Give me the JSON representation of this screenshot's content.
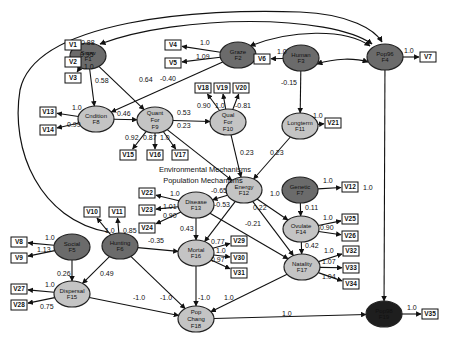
{
  "title": "",
  "captions": {
    "env": "Environmental Mechanisms",
    "pop": "Population Mechanisms"
  },
  "colors": {
    "dark": "#6b6b6b",
    "light": "#c4c4c4",
    "black": "#1e1e1e"
  },
  "factors": [
    {
      "id": "F1",
      "name": "Snow",
      "x": 88,
      "y": 56,
      "shade": "dark"
    },
    {
      "id": "F2",
      "name": "Graze",
      "x": 238,
      "y": 55,
      "shade": "dark"
    },
    {
      "id": "F3",
      "name": "Human",
      "x": 301,
      "y": 58,
      "shade": "dark"
    },
    {
      "id": "F4",
      "name": "Pop96",
      "x": 385,
      "y": 57,
      "shade": "dark"
    },
    {
      "id": "F8",
      "name": "Cndition",
      "x": 96,
      "y": 119,
      "shade": "light"
    },
    {
      "id": "F9",
      "name": "Quant For",
      "x": 155,
      "y": 120,
      "shade": "light"
    },
    {
      "id": "F10",
      "name": "Qual For",
      "x": 228,
      "y": 122,
      "shade": "light"
    },
    {
      "id": "F11",
      "name": "Longterm",
      "x": 300,
      "y": 126,
      "shade": "light"
    },
    {
      "id": "F12",
      "name": "Energy",
      "x": 244,
      "y": 190,
      "shade": "light"
    },
    {
      "id": "F7",
      "name": "Genetic",
      "x": 300,
      "y": 190,
      "shade": "dark"
    },
    {
      "id": "F13",
      "name": "Disease",
      "x": 196,
      "y": 205,
      "shade": "light"
    },
    {
      "id": "F14",
      "name": "Ovulate",
      "x": 301,
      "y": 229,
      "shade": "light"
    },
    {
      "id": "F5",
      "name": "Social",
      "x": 72,
      "y": 247,
      "shade": "dark"
    },
    {
      "id": "F6",
      "name": "Hunting",
      "x": 120,
      "y": 246,
      "shade": "dark"
    },
    {
      "id": "F16",
      "name": "Mortal",
      "x": 196,
      "y": 253,
      "shade": "light"
    },
    {
      "id": "F17",
      "name": "Natality",
      "x": 302,
      "y": 267,
      "shade": "light"
    },
    {
      "id": "F15",
      "name": "Dispersal",
      "x": 72,
      "y": 294,
      "shade": "light"
    },
    {
      "id": "F18",
      "name": "Pop Chang",
      "x": 196,
      "y": 319,
      "shade": "light"
    },
    {
      "id": "F19",
      "name": "Pop98",
      "x": 384,
      "y": 314,
      "shade": "black"
    }
  ],
  "indicators": [
    {
      "id": "V1",
      "x": 73,
      "y": 45
    },
    {
      "id": "V2",
      "x": 73,
      "y": 62
    },
    {
      "id": "V3",
      "x": 73,
      "y": 78
    },
    {
      "id": "V4",
      "x": 173,
      "y": 45
    },
    {
      "id": "V5",
      "x": 173,
      "y": 63
    },
    {
      "id": "V6",
      "x": 262,
      "y": 59
    },
    {
      "id": "V7",
      "x": 428,
      "y": 57
    },
    {
      "id": "V13",
      "x": 48,
      "y": 112
    },
    {
      "id": "V14",
      "x": 48,
      "y": 130
    },
    {
      "id": "V18",
      "x": 203,
      "y": 88
    },
    {
      "id": "V19",
      "x": 222,
      "y": 88
    },
    {
      "id": "V20",
      "x": 241,
      "y": 88
    },
    {
      "id": "V21",
      "x": 333,
      "y": 123
    },
    {
      "id": "V15",
      "x": 128,
      "y": 155
    },
    {
      "id": "V16",
      "x": 155,
      "y": 155
    },
    {
      "id": "V17",
      "x": 180,
      "y": 155
    },
    {
      "id": "V12",
      "x": 350,
      "y": 187
    },
    {
      "id": "V22",
      "x": 147,
      "y": 193
    },
    {
      "id": "V23",
      "x": 147,
      "y": 210
    },
    {
      "id": "V24",
      "x": 147,
      "y": 228
    },
    {
      "id": "V10",
      "x": 92,
      "y": 212
    },
    {
      "id": "V11",
      "x": 117,
      "y": 212
    },
    {
      "id": "V25",
      "x": 350,
      "y": 219
    },
    {
      "id": "V26",
      "x": 350,
      "y": 236
    },
    {
      "id": "V8",
      "x": 19,
      "y": 242
    },
    {
      "id": "V9",
      "x": 19,
      "y": 258
    },
    {
      "id": "V29",
      "x": 239,
      "y": 241
    },
    {
      "id": "V30",
      "x": 239,
      "y": 258
    },
    {
      "id": "V31",
      "x": 239,
      "y": 273
    },
    {
      "id": "V32",
      "x": 351,
      "y": 251
    },
    {
      "id": "V33",
      "x": 351,
      "y": 268
    },
    {
      "id": "V34",
      "x": 351,
      "y": 284
    },
    {
      "id": "V27",
      "x": 19,
      "y": 289
    },
    {
      "id": "V28",
      "x": 19,
      "y": 305
    },
    {
      "id": "V35",
      "x": 430,
      "y": 314
    }
  ],
  "paths": [
    {
      "from": "F1",
      "to": "V1",
      "coef": "0.88",
      "lx": 81,
      "ly": 45
    },
    {
      "from": "F1",
      "to": "V2",
      "coef": "0.95",
      "lx": 80,
      "ly": 57
    },
    {
      "from": "F1",
      "to": "V3",
      "coef": "1.0",
      "lx": 84,
      "ly": 69
    },
    {
      "from": "F1",
      "to": "F8",
      "coef": "0.58",
      "lx": 95,
      "ly": 83
    },
    {
      "from": "F1",
      "to": "F9",
      "coef": "0.64",
      "lx": 139,
      "ly": 82
    },
    {
      "from": "F2",
      "to": "V4",
      "coef": "1.0",
      "lx": 200,
      "ly": 45
    },
    {
      "from": "F2",
      "to": "V5",
      "coef": "1.09",
      "lx": 196,
      "ly": 59
    },
    {
      "from": "F2",
      "to": "F8",
      "coef": "-0.40",
      "lx": 160,
      "ly": 81
    },
    {
      "from": "F3",
      "to": "V6",
      "coef": "1.0",
      "lx": 277,
      "ly": 54
    },
    {
      "from": "F3",
      "to": "F11",
      "coef": "-0.15",
      "lx": 281,
      "ly": 85
    },
    {
      "from": "F4",
      "to": "V7",
      "coef": "1.0",
      "lx": 404,
      "ly": 53
    },
    {
      "from": "F4",
      "to": "F19",
      "coef": "1.0",
      "lx": 363,
      "ly": 190
    },
    {
      "from": "F8",
      "to": "V13",
      "coef": "1.0",
      "lx": 72,
      "ly": 110
    },
    {
      "from": "F8",
      "to": "V14",
      "coef": "0.99",
      "lx": 67,
      "ly": 127
    },
    {
      "from": "F8",
      "to": "F9",
      "coef": "0.46",
      "lx": 117,
      "ly": 116
    },
    {
      "from": "F9",
      "to": "V15",
      "coef": "0.92",
      "lx": 125,
      "ly": 140
    },
    {
      "from": "F9",
      "to": "V16",
      "coef": "0.87",
      "lx": 143,
      "ly": 140
    },
    {
      "from": "F9",
      "to": "V17",
      "coef": "1.0",
      "lx": 160,
      "ly": 140
    },
    {
      "from": "F9",
      "to": "F10",
      "coef": "0.53",
      "lx": 177,
      "ly": 115
    },
    {
      "from": "F9",
      "to": "F12",
      "coef": "0.23",
      "lx": 177,
      "ly": 128
    },
    {
      "from": "F10",
      "to": "V18",
      "coef": "0.90",
      "lx": 197,
      "ly": 108
    },
    {
      "from": "F10",
      "to": "V19",
      "coef": "1.0",
      "lx": 215,
      "ly": 108
    },
    {
      "from": "F10",
      "to": "V20",
      "coef": "-0.81",
      "lx": 235,
      "ly": 108
    },
    {
      "from": "F10",
      "to": "F12",
      "coef": "0.23",
      "lx": 240,
      "ly": 155
    },
    {
      "from": "F11",
      "to": "V21",
      "coef": "1.0",
      "lx": 313,
      "ly": 118
    },
    {
      "from": "F11",
      "to": "F12",
      "coef": "0.23",
      "lx": 270,
      "ly": 155
    },
    {
      "from": "F12",
      "to": "F13",
      "coef": "-0.65",
      "lx": 211,
      "ly": 193
    },
    {
      "from": "F12",
      "to": "F16",
      "coef": "-0.53",
      "lx": 214,
      "ly": 207
    },
    {
      "from": "F12",
      "to": "F14",
      "coef": "1.0",
      "lx": 270,
      "ly": 196
    },
    {
      "from": "F12",
      "to": "F17",
      "coef": "0.22",
      "lx": 253,
      "ly": 210
    },
    {
      "from": "F7",
      "to": "V12",
      "coef": "1.0",
      "lx": 323,
      "ly": 183
    },
    {
      "from": "F7",
      "to": "F14",
      "coef": "0.11",
      "lx": 305,
      "ly": 210
    },
    {
      "from": "F13",
      "to": "V22",
      "coef": "1.0",
      "lx": 170,
      "ly": 196
    },
    {
      "from": "F13",
      "to": "V23",
      "coef": "1.01",
      "lx": 163,
      "ly": 209
    },
    {
      "from": "F13",
      "to": "V24",
      "coef": "0.90",
      "lx": 163,
      "ly": 218
    },
    {
      "from": "F13",
      "to": "F16",
      "coef": "0.43",
      "lx": 180,
      "ly": 231
    },
    {
      "from": "F13",
      "to": "F17",
      "coef": "-0.21",
      "lx": 245,
      "ly": 226
    },
    {
      "from": "F14",
      "to": "V25",
      "coef": "1.0",
      "lx": 323,
      "ly": 220
    },
    {
      "from": "F14",
      "to": "V26",
      "coef": "0.90",
      "lx": 320,
      "ly": 230
    },
    {
      "from": "F14",
      "to": "F17",
      "coef": "0.42",
      "lx": 305,
      "ly": 248
    },
    {
      "from": "F6",
      "to": "V10",
      "coef": "1.0",
      "lx": 105,
      "ly": 233
    },
    {
      "from": "F6",
      "to": "V11",
      "coef": "0.85",
      "lx": 123,
      "ly": 233
    },
    {
      "from": "F6",
      "to": "F16",
      "coef": "-0.35",
      "lx": 148,
      "ly": 243
    },
    {
      "from": "F6",
      "to": "F15",
      "coef": "0.49",
      "lx": 100,
      "ly": 276
    },
    {
      "from": "F6",
      "to": "F18",
      "coef": "-1.0",
      "lx": 160,
      "ly": 300
    },
    {
      "from": "F5",
      "to": "V8",
      "coef": "1.0",
      "lx": 45,
      "ly": 240
    },
    {
      "from": "F5",
      "to": "V9",
      "coef": "1.13",
      "lx": 37,
      "ly": 252
    },
    {
      "from": "F5",
      "to": "F15",
      "coef": "0.26",
      "lx": 57,
      "ly": 276
    },
    {
      "from": "F16",
      "to": "V29",
      "coef": "0.77",
      "lx": 211,
      "ly": 244
    },
    {
      "from": "F16",
      "to": "V30",
      "coef": "1.0",
      "lx": 216,
      "ly": 253
    },
    {
      "from": "F16",
      "to": "V31",
      "coef": "0.97",
      "lx": 211,
      "ly": 262
    },
    {
      "from": "F16",
      "to": "F18",
      "coef": "-1.0",
      "lx": 198,
      "ly": 300
    },
    {
      "from": "F17",
      "to": "V32",
      "coef": "1.0",
      "lx": 324,
      "ly": 253
    },
    {
      "from": "F17",
      "to": "V33",
      "coef": "1.07",
      "lx": 322,
      "ly": 264
    },
    {
      "from": "F17",
      "to": "V34",
      "coef": "1.04",
      "lx": 322,
      "ly": 279
    },
    {
      "from": "F17",
      "to": "F18",
      "coef": "1.0",
      "lx": 224,
      "ly": 300
    },
    {
      "from": "F15",
      "to": "V27",
      "coef": "1.0",
      "lx": 45,
      "ly": 287
    },
    {
      "from": "F15",
      "to": "V28",
      "coef": "0.75",
      "lx": 40,
      "ly": 309
    },
    {
      "from": "F15",
      "to": "F18",
      "coef": "-1.0",
      "lx": 133,
      "ly": 300
    },
    {
      "from": "F18",
      "to": "F19",
      "coef": "1.0",
      "lx": 282,
      "ly": 316
    },
    {
      "from": "F19",
      "to": "V35",
      "coef": "1.0",
      "lx": 407,
      "ly": 310
    }
  ],
  "correlations": [
    {
      "a": "F2",
      "b": "F4"
    },
    {
      "a": "F3",
      "b": "F4"
    },
    {
      "a": "F1",
      "b": "F4"
    }
  ]
}
